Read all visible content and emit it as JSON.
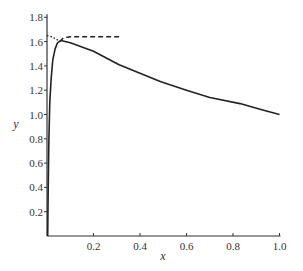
{
  "chart_data": {
    "type": "line",
    "title": "",
    "xlabel": "x",
    "ylabel": "y",
    "xlim": [
      0,
      1.0
    ],
    "ylim": [
      0,
      1.8
    ],
    "grid": false,
    "legend": null,
    "x_ticks": [
      "0.2",
      "0.4",
      "0.6",
      "0.8",
      "1.0"
    ],
    "y_ticks": [
      "0.2",
      "0.4",
      "0.6",
      "0.8",
      "1.0",
      "1.2",
      "1.4",
      "1.6",
      "1.8"
    ],
    "series": [
      {
        "name": "solution",
        "style": "solid",
        "x": [
          0.003,
          0.005,
          0.008,
          0.012,
          0.018,
          0.025,
          0.035,
          0.045,
          0.06,
          0.1,
          0.2,
          0.31,
          0.4,
          0.49,
          0.6,
          0.7,
          0.83,
          0.92,
          1.0
        ],
        "y": [
          0.0,
          0.4,
          0.8,
          1.1,
          1.3,
          1.45,
          1.54,
          1.59,
          1.61,
          1.59,
          1.52,
          1.41,
          1.34,
          1.27,
          1.2,
          1.14,
          1.09,
          1.04,
          1.0
        ]
      },
      {
        "name": "inner approximation",
        "style": "dotted",
        "x": [
          0.0,
          0.02,
          0.04,
          0.055
        ],
        "y": [
          1.65,
          1.64,
          1.62,
          1.6
        ]
      },
      {
        "name": "outer approximation",
        "style": "dashed",
        "x": [
          0.055,
          0.07,
          0.1,
          0.2,
          0.31
        ],
        "y": [
          1.6,
          1.63,
          1.64,
          1.64,
          1.64
        ]
      }
    ]
  }
}
